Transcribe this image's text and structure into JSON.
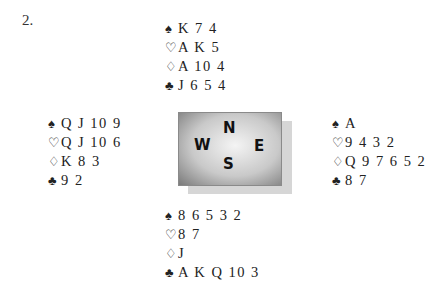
{
  "problem_number": "2.",
  "suit_symbols": {
    "spades": "♠",
    "hearts": "♡",
    "diamonds": "♢",
    "clubs": "♣"
  },
  "hands": {
    "north": {
      "spades": "K 7 4",
      "hearts": "A K 5",
      "diamonds": "A 10 4",
      "clubs": "J 6 5 4"
    },
    "west": {
      "spades": "Q J 10 9",
      "hearts": "Q J 10 6",
      "diamonds": "K 8 3",
      "clubs": "9 2"
    },
    "east": {
      "spades": "A",
      "hearts": "9 4 3 2",
      "diamonds": "Q 9 7 6 5 2",
      "clubs": "8 7"
    },
    "south": {
      "spades": "8 6 5 3 2",
      "hearts": "8 7",
      "diamonds": "J",
      "clubs": "A K Q 10 3"
    }
  },
  "compass": {
    "north": "N",
    "west": "W",
    "east": "E",
    "south": "S"
  }
}
